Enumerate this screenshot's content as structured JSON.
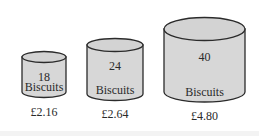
{
  "colors": {
    "tin_fill": "#d7d7d7",
    "tin_top_fill": "#d3d3d3",
    "outline": "#2b2b2b",
    "text": "#2a2a2a",
    "background": "#ffffff"
  },
  "tins": [
    {
      "count": "18",
      "unit": "Biscuits",
      "price": "£2.16"
    },
    {
      "count": "24",
      "unit": "Biscuits",
      "price": "£2.64"
    },
    {
      "count": "40",
      "unit": "Biscuits",
      "price": "£4.80"
    }
  ]
}
